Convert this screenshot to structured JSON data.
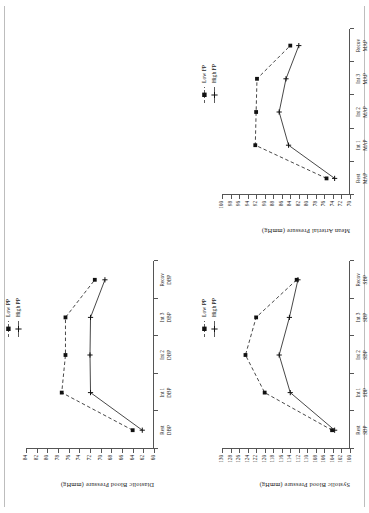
{
  "figure": {
    "orientation": "rotated-90-ccw",
    "unit": "mmHg"
  },
  "charts": [
    {
      "id": "dbp",
      "chart_data": {
        "type": "line",
        "title": "",
        "xlabel": "",
        "ylabel": "Diastolic Blood Pressure  (mmHg)",
        "categories": [
          "Rest\nDBP",
          "Int 1\nDBP",
          "Int 2\nDBP",
          "Int 3\nDBP",
          "Recov\nDBP"
        ],
        "tick_labels": [
          "84",
          "82",
          "80",
          "78",
          "76",
          "74",
          "72",
          "70",
          "68",
          "66",
          "64",
          "62",
          "60"
        ],
        "ylim": [
          60,
          84
        ],
        "grid": false,
        "legend_position": "top-right",
        "series": [
          {
            "name": "Low PP",
            "marker": "filled-square",
            "line": "dashed",
            "values": [
              64.0,
              77.3,
              76.6,
              76.6,
              71.1
            ]
          },
          {
            "name": "High PP",
            "marker": "plus",
            "line": "solid",
            "values": [
              62.2,
              71.9,
              72.0,
              71.9,
              69.2
            ]
          }
        ]
      }
    },
    {
      "id": "sbp",
      "chart_data": {
        "type": "line",
        "title": "",
        "xlabel": "",
        "ylabel": "Systolic Blood Pressure  (mmHg)",
        "categories": [
          "Rest\nSBP",
          "Int 1\nSBP",
          "Int 2\nSBP",
          "Int 3\nSBP",
          "Recov\nSBP"
        ],
        "tick_labels": [
          "130",
          "128",
          "126",
          "124",
          "122",
          "120",
          "118",
          "116",
          "114",
          "112",
          "110",
          "108",
          "106",
          "104",
          "102",
          "100"
        ],
        "ylim": [
          100,
          130
        ],
        "grid": false,
        "legend_position": "top-right",
        "series": [
          {
            "name": "Low PP",
            "marker": "filled-square",
            "line": "dashed",
            "values": [
              104.2,
              120.0,
              124.5,
              122.0,
              112.5
            ]
          },
          {
            "name": "High PP",
            "marker": "plus",
            "line": "solid",
            "values": [
              103.6,
              114.0,
              116.6,
              114.2,
              112.2
            ]
          }
        ]
      }
    },
    {
      "id": "map",
      "chart_data": {
        "type": "line",
        "title": "",
        "xlabel": "",
        "ylabel": "Mean Arterial Pressure  (mmHg)",
        "categories": [
          "Rest\nMAP",
          "Int 1\nMAP",
          "Int 2\nMAP",
          "Int 3\nMAP",
          "Recov\nMAP"
        ],
        "tick_labels": [
          "100",
          "98",
          "96",
          "94",
          "92",
          "90",
          "88",
          "86",
          "84",
          "82",
          "80",
          "78",
          "76",
          "74",
          "72",
          "70"
        ],
        "ylim": [
          70,
          100
        ],
        "grid": false,
        "legend_position": "top-right",
        "series": [
          {
            "name": "Low FP",
            "marker": "filled-square",
            "line": "dashed",
            "values": [
              75.5,
              92.2,
              92.0,
              91.8,
              84.0
            ]
          },
          {
            "name": "High FP",
            "marker": "plus",
            "line": "solid",
            "values": [
              73.6,
              84.4,
              86.6,
              85.0,
              82.0
            ]
          }
        ]
      }
    }
  ]
}
